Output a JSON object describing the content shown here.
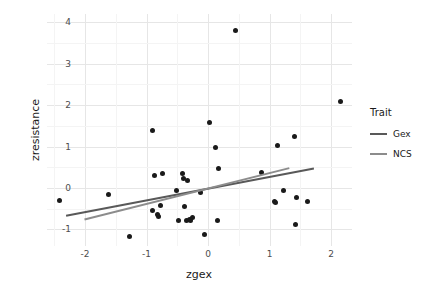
{
  "chart_data": {
    "type": "scatter",
    "title": "",
    "xlabel": "zgex",
    "ylabel": "zresistance",
    "xlim": [
      -2.62,
      2.34
    ],
    "ylim": [
      -1.4,
      4.2
    ],
    "xticks": [
      "-2",
      "-1",
      "0",
      "1",
      "2"
    ],
    "xtick_values": [
      -2,
      -1,
      0,
      1,
      2
    ],
    "yticks": [
      "4",
      "3",
      "2",
      "1",
      "0",
      "-1"
    ],
    "ytick_values": [
      4,
      3,
      2,
      1,
      0,
      -1
    ],
    "grid": true,
    "legend_position": "right",
    "legend_title": "Trait",
    "points": [
      [
        -2.42,
        -0.29
      ],
      [
        -1.62,
        -0.15
      ],
      [
        -1.28,
        -1.18
      ],
      [
        -0.9,
        1.4
      ],
      [
        -0.88,
        0.3
      ],
      [
        -0.82,
        -0.63
      ],
      [
        -0.8,
        -0.69
      ],
      [
        -0.78,
        -0.42
      ],
      [
        -0.74,
        0.36
      ],
      [
        -0.9,
        -0.55
      ],
      [
        -0.52,
        -0.05
      ],
      [
        -0.48,
        -0.79
      ],
      [
        -0.42,
        0.35
      ],
      [
        -0.4,
        0.22
      ],
      [
        -0.38,
        -0.44
      ],
      [
        -0.36,
        -0.79
      ],
      [
        -0.33,
        0.18
      ],
      [
        -0.3,
        -0.76
      ],
      [
        -0.28,
        -0.78
      ],
      [
        -0.26,
        -0.72
      ],
      [
        -0.12,
        -0.11
      ],
      [
        -0.06,
        -1.12
      ],
      [
        0.02,
        1.58
      ],
      [
        0.12,
        0.99
      ],
      [
        0.15,
        -0.78
      ],
      [
        0.17,
        0.46
      ],
      [
        0.44,
        3.8
      ],
      [
        0.86,
        0.37
      ],
      [
        1.08,
        -0.33
      ],
      [
        1.1,
        -0.34
      ],
      [
        1.13,
        1.03
      ],
      [
        1.22,
        -0.05
      ],
      [
        1.4,
        1.25
      ],
      [
        1.42,
        -0.89
      ],
      [
        1.44,
        -0.22
      ],
      [
        1.62,
        -0.32
      ],
      [
        2.16,
        2.1
      ]
    ],
    "series": [
      {
        "name": "Gex",
        "type": "line",
        "color": "#595959",
        "x_start": -2.31,
        "y_start": -0.67,
        "x_end": 1.72,
        "y_end": 0.47
      },
      {
        "name": "NCS",
        "type": "line",
        "color": "#8c8c8c",
        "x_start": -2.01,
        "y_start": -0.76,
        "x_end": 1.32,
        "y_end": 0.48
      }
    ]
  },
  "legend": {
    "title": "Trait",
    "items": [
      {
        "label": "Gex",
        "color": "#595959"
      },
      {
        "label": "NCS",
        "color": "#8c8c8c"
      }
    ]
  },
  "axes": {
    "x_title": "zgex",
    "y_title": "zresistance"
  }
}
